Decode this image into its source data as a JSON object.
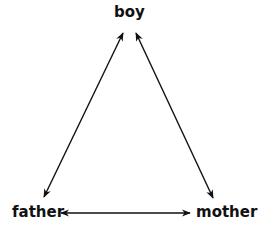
{
  "diagram": {
    "type": "relationship-triangle",
    "nodes": [
      {
        "id": "boy",
        "label": "boy"
      },
      {
        "id": "father",
        "label": "father"
      },
      {
        "id": "mother",
        "label": "mother"
      }
    ],
    "edges": [
      {
        "from": "boy",
        "to": "father",
        "direction": "bidirectional"
      },
      {
        "from": "boy",
        "to": "mother",
        "direction": "bidirectional"
      },
      {
        "from": "father",
        "to": "mother",
        "direction": "bidirectional"
      }
    ],
    "colors": {
      "line": "#111111",
      "text": "#111111",
      "background": "#ffffff"
    }
  }
}
